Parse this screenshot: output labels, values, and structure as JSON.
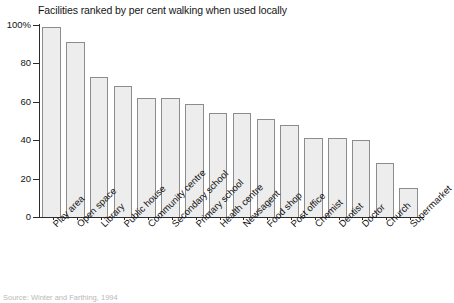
{
  "chart_data": {
    "type": "bar",
    "title": "Facilities ranked by per cent walking when used locally",
    "xlabel": "",
    "ylabel": "",
    "ylim": [
      0,
      100
    ],
    "grid": false,
    "legend": "none",
    "y_ticks": [
      "0",
      "20",
      "40",
      "60",
      "80",
      "100%"
    ],
    "y_tick_values": [
      0,
      20,
      40,
      60,
      80,
      100
    ],
    "categories": [
      "Play area",
      "Open space",
      "Library",
      "Public house",
      "Community centre",
      "Secondary school",
      "Primary school",
      "Health centre",
      "Newsagent",
      "Food shop",
      "Post office",
      "Chemist",
      "Dentist",
      "Doctor",
      "Church",
      "Supermarket"
    ],
    "values": [
      99,
      91,
      73,
      68,
      62,
      62,
      59,
      54,
      54,
      51,
      48,
      41,
      41,
      40,
      28,
      15
    ],
    "bar_fill_color": "#ededed",
    "bar_border_color": "#8c8c8c",
    "axis_color": "#2b2b2b"
  },
  "source": {
    "text": "Source: Winter and Farthing, 1994"
  }
}
